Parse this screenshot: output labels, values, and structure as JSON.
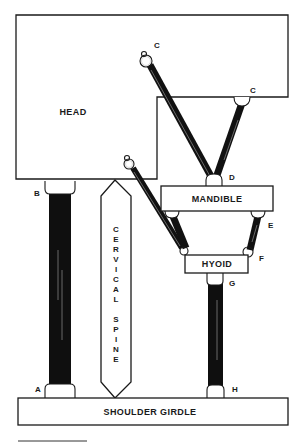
{
  "diagram": {
    "title": "",
    "structures": {
      "head": "HEAD",
      "mandible": "MANDIBLE",
      "hyoid": "HYOID",
      "shoulder_girdle": "SHOULDER GIRDLE",
      "cervical_spine": [
        "C",
        "E",
        "R",
        "V",
        "I",
        "C",
        "A",
        "L",
        "",
        "S",
        "P",
        "I",
        "N",
        "E"
      ]
    },
    "points": {
      "a": "A",
      "b": "B",
      "c1": "C",
      "c2": "C",
      "d": "D",
      "e": "E",
      "f": "F",
      "g": "G",
      "h": "H"
    },
    "connections": [
      {
        "from": "A (shoulder girdle)",
        "to": "B (head)",
        "type": "thick band"
      },
      {
        "from": "C (head, upper)",
        "to": "D (mandible)",
        "type": "band"
      },
      {
        "from": "C (head, right)",
        "to": "D (mandible)",
        "type": "band"
      },
      {
        "from": "head (lower ring)",
        "to": "hyoid",
        "type": "band"
      },
      {
        "from": "mandible",
        "to": "hyoid",
        "type": "band"
      },
      {
        "from": "E (mandible)",
        "to": "F (hyoid)",
        "type": "band"
      },
      {
        "from": "G (hyoid)",
        "to": "H (shoulder girdle)",
        "type": "band"
      }
    ]
  }
}
